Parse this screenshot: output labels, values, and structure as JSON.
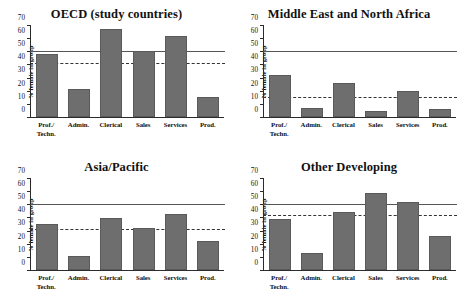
{
  "figure": {
    "ylabel": "% female in group",
    "categories": [
      "Prof./\nTechn.",
      "Admin.",
      "Clerical",
      "Sales",
      "Services",
      "Prod."
    ],
    "yticks": [
      0,
      10,
      20,
      30,
      40,
      50,
      60,
      70
    ],
    "bar_color": "#6e6e6e",
    "solid_line_color": "#555555",
    "dashed_line_color": "#333333"
  },
  "panels": [
    {
      "title": "OECD (study countries)",
      "values": [
        48.5,
        21.5,
        67.5,
        51,
        62,
        15.5
      ],
      "solid_ref": 50,
      "dashed_ref": 41
    },
    {
      "title": "Middle East and North Africa",
      "values": [
        32,
        7,
        26,
        5,
        20,
        6
      ],
      "solid_ref": 50,
      "dashed_ref": 15
    },
    {
      "title": "Asia/Pacific",
      "values": [
        35.5,
        10.5,
        40,
        32,
        43,
        22.5
      ],
      "solid_ref": 50,
      "dashed_ref": 31
    },
    {
      "title": "Other Developing",
      "values": [
        39,
        13,
        45,
        59,
        52,
        26
      ],
      "solid_ref": 50,
      "dashed_ref": 42
    }
  ],
  "chart_data": {
    "type": "bar",
    "xlabel": "",
    "ylabel": "% female in group",
    "ylim": [
      0,
      70
    ],
    "yticks": [
      0,
      10,
      20,
      30,
      40,
      50,
      60,
      70
    ],
    "grid": false,
    "legend": "none",
    "panel_layout": "2x2",
    "categories": [
      "Prof./Techn.",
      "Admin.",
      "Clerical",
      "Sales",
      "Services",
      "Prod."
    ],
    "series": [
      {
        "name": "OECD (study countries)",
        "values": [
          48.5,
          21.5,
          67.5,
          51,
          62,
          15.5
        ]
      },
      {
        "name": "Middle East and North Africa",
        "values": [
          32,
          7,
          26,
          5,
          20,
          6
        ]
      },
      {
        "name": "Asia/Pacific",
        "values": [
          35.5,
          10.5,
          40,
          32,
          43,
          22.5
        ]
      },
      {
        "name": "Other Developing",
        "values": [
          39,
          13,
          45,
          59,
          52,
          26
        ]
      }
    ],
    "annotations": [
      {
        "panel": "OECD (study countries)",
        "type": "hline",
        "style": "solid",
        "y": 50
      },
      {
        "panel": "OECD (study countries)",
        "type": "hline",
        "style": "dashed",
        "y": 41
      },
      {
        "panel": "Middle East and North Africa",
        "type": "hline",
        "style": "solid",
        "y": 50
      },
      {
        "panel": "Middle East and North Africa",
        "type": "hline",
        "style": "dashed",
        "y": 15
      },
      {
        "panel": "Asia/Pacific",
        "type": "hline",
        "style": "solid",
        "y": 50
      },
      {
        "panel": "Asia/Pacific",
        "type": "hline",
        "style": "dashed",
        "y": 31
      },
      {
        "panel": "Other Developing",
        "type": "hline",
        "style": "solid",
        "y": 50
      },
      {
        "panel": "Other Developing",
        "type": "hline",
        "style": "dashed",
        "y": 42
      }
    ]
  }
}
